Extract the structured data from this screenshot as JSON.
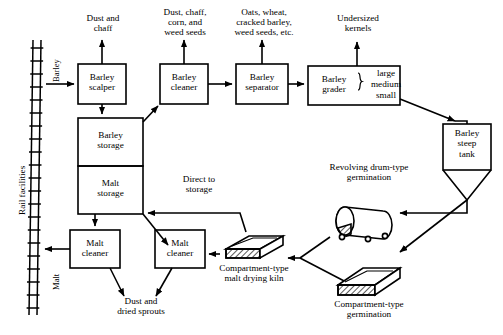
{
  "figure": {
    "kind": "process-flow-diagram",
    "stroke_color": "#000000",
    "background_color": "#ffffff"
  },
  "rail": {
    "facilities_label": "Rail facilities",
    "inbound_label": "Barley",
    "outbound_label": "Malt"
  },
  "boxes": {
    "barley_scalper": "Barley\nscalper",
    "barley_storage": "Barley\nstorage",
    "malt_storage": "Malt\nstorage",
    "barley_cleaner": "Barley\ncleaner",
    "barley_separator": "Barley\nseparator",
    "barley_grader": "Barley\ngrader",
    "barley_steep_tank": "Barley\nsteep\ntank",
    "malt_cleaner_left": "Malt\ncleaner",
    "malt_cleaner_right": "Malt\ncleaner"
  },
  "grader_grades": {
    "large": "large",
    "medium": "medium",
    "small": "small"
  },
  "waste_labels": {
    "scalper_waste": "Dust and\nchaff",
    "cleaner_waste": "Dust, chaff,\ncorn, and\nweed seeds",
    "separator_waste": "Oats, wheat,\ncracked barley,\nweed seeds, etc.",
    "grader_waste": "Undersized\nkernels",
    "malt_cleaner_waste": "Dust and\ndried sprouts"
  },
  "equipment_labels": {
    "revolving_drum": "Revolving drum-type\ngermination",
    "compartment_germination": "Compartment-type\ngermination",
    "malt_drying_kiln": "Compartment-type\nmalt drying kiln"
  },
  "flow_labels": {
    "direct_to_storage": "Direct to\nstorage"
  }
}
